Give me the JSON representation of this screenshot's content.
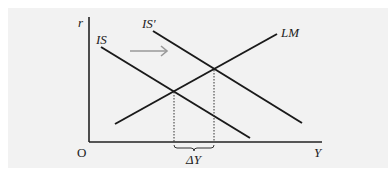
{
  "diagram": {
    "type": "IS-LM",
    "axes": {
      "y_label": "r",
      "x_label": "Y",
      "origin_label": "O"
    },
    "curves": [
      {
        "name": "IS",
        "label": "IS",
        "x1": 101,
        "y1": 47,
        "x2": 250,
        "y2": 138,
        "color": "#1a1a1a"
      },
      {
        "name": "IS-prime",
        "label": "IS′",
        "x1": 153,
        "y1": 31,
        "x2": 302,
        "y2": 123,
        "color": "#1a1a1a"
      },
      {
        "name": "LM",
        "label": "LM",
        "x1": 115,
        "y1": 124,
        "x2": 277,
        "y2": 34,
        "color": "#1a1a1a"
      }
    ],
    "shift_arrow": {
      "x1": 130,
      "y1": 51,
      "x2": 167,
      "y2": 51,
      "color": "#999999",
      "meaning": "IS shifts right"
    },
    "equilibria": [
      {
        "x": 174,
        "y": 92
      },
      {
        "x": 214,
        "y": 70
      }
    ],
    "delta_label": "ΔY"
  }
}
